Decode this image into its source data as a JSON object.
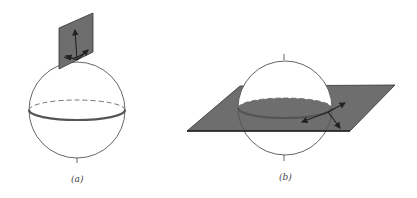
{
  "figure": {
    "panels": [
      {
        "id": "a",
        "caption": "(a)",
        "description": "Sphere with tangent plane at the north pole, tangent vectors drawn in the plane"
      },
      {
        "id": "b",
        "caption": "(b)",
        "description": "Sphere cut by a horizontal plane through the equator, tangent vectors at an equator point"
      }
    ],
    "colors": {
      "plane_fill": "#6e6e6e",
      "outline": "#555555",
      "background": "#ffffff"
    }
  }
}
